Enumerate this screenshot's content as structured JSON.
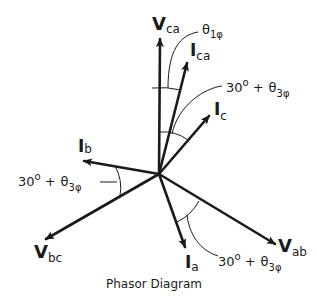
{
  "diagram": {
    "title": "Phasor Diagram",
    "origin": [
      159,
      174
    ],
    "vectors": [
      {
        "id": "Vca",
        "main": "V",
        "sub": "ca",
        "tip": [
          160,
          36
        ],
        "bold": true
      },
      {
        "id": "Ica",
        "main": "I",
        "sub": "ca",
        "tip": [
          188,
          60
        ],
        "bold": false
      },
      {
        "id": "Ic",
        "main": "I",
        "sub": "c",
        "tip": [
          212,
          113
        ],
        "bold": false
      },
      {
        "id": "Ib",
        "main": "I",
        "sub": "b",
        "tip": [
          81,
          161
        ],
        "bold": false
      },
      {
        "id": "Vbc",
        "main": "V",
        "sub": "bc",
        "tip": [
          43,
          241
        ],
        "bold": true
      },
      {
        "id": "Ia",
        "main": "I",
        "sub": "a",
        "tip": [
          186,
          250
        ],
        "bold": false
      },
      {
        "id": "Vab",
        "main": "V",
        "sub": "ab",
        "tip": [
          278,
          246
        ],
        "bold": true
      }
    ],
    "angle_labels": {
      "theta1": {
        "main": "θ",
        "sub": "1φ"
      },
      "theta3_top": {
        "prefix": "30",
        "deg": "o",
        "plus": "+",
        "main": "θ",
        "sub": "3φ"
      },
      "theta3_left": {
        "prefix": "30",
        "deg": "o",
        "plus": "+",
        "main": "θ",
        "sub": "3φ"
      },
      "theta3_bottom": {
        "prefix": "30",
        "deg": "o",
        "plus": "+",
        "main": "θ",
        "sub": "3φ"
      }
    }
  }
}
